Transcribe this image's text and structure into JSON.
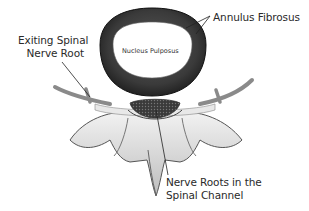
{
  "diagram": {
    "labels": {
      "annulus_fibrosus": "Annulus Fibrosus",
      "nucleus_pulposus": "Nucleus Pulposus",
      "exiting_spinal_nerve_root_line1": "Exiting Spinal",
      "exiting_spinal_nerve_root_line2": "Nerve Root",
      "nerve_roots_line1": "Nerve Roots in the",
      "nerve_roots_line2": "Spinal Channel"
    },
    "colors": {
      "background": "#ffffff",
      "annulus": "#2b2b2b",
      "nucleus": "#ffffff",
      "bone": "#e6e6e6",
      "bone_shadow": "#6d6d6d",
      "nerve": "#8a8a8a",
      "text": "#2a2a2a"
    }
  }
}
